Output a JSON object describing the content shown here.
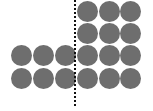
{
  "diagram": {
    "circle_color": "#6e6e6e",
    "divider_color": "#111111",
    "left_group": {
      "rows": 2,
      "cols": 3,
      "count": 6
    },
    "right_group": {
      "rows": 4,
      "cols": 3,
      "count": 12
    },
    "total_circles": 18,
    "circles": [
      {
        "x": 77,
        "y": 1
      },
      {
        "x": 99,
        "y": 1
      },
      {
        "x": 120,
        "y": 1
      },
      {
        "x": 77,
        "y": 23
      },
      {
        "x": 99,
        "y": 23
      },
      {
        "x": 120,
        "y": 23
      },
      {
        "x": 11,
        "y": 45
      },
      {
        "x": 33,
        "y": 45
      },
      {
        "x": 55,
        "y": 45
      },
      {
        "x": 77,
        "y": 45
      },
      {
        "x": 99,
        "y": 45
      },
      {
        "x": 120,
        "y": 45
      },
      {
        "x": 11,
        "y": 68
      },
      {
        "x": 33,
        "y": 68
      },
      {
        "x": 55,
        "y": 68
      },
      {
        "x": 77,
        "y": 68
      },
      {
        "x": 99,
        "y": 68
      },
      {
        "x": 120,
        "y": 68
      }
    ]
  }
}
